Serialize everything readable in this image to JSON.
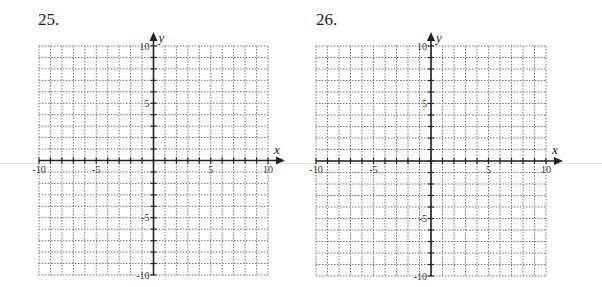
{
  "problems": [
    {
      "number": "25.",
      "x_label": "x",
      "y_label": "y"
    },
    {
      "number": "26.",
      "x_label": "x",
      "y_label": "y"
    }
  ],
  "axes": {
    "x_range": [
      -10,
      10
    ],
    "y_range": [
      -10,
      10
    ],
    "grid_step": 1,
    "tick_labels_x": [
      "-10",
      "-5",
      "5",
      "10"
    ],
    "tick_labels_y": [
      "10",
      "5",
      "-5",
      "-10"
    ]
  },
  "colors": {
    "grid": "#777777",
    "axis": "#222222"
  }
}
